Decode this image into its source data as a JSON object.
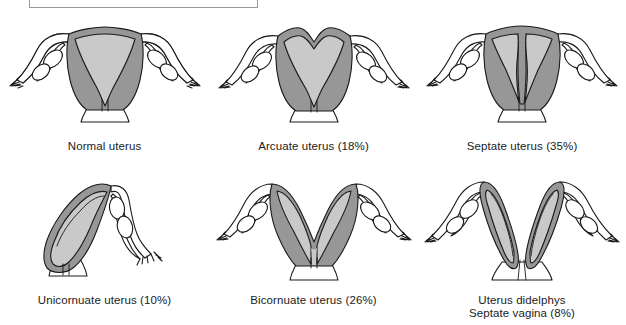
{
  "figure": {
    "title_box": {
      "text": "",
      "border_color": "#9a9a9a"
    },
    "colors": {
      "myometrium": "#979797",
      "endometrium": "#c9c9c9",
      "outline": "#1a1a1a",
      "background": "#ffffff",
      "caption": "#1b1b1b"
    },
    "panels": [
      {
        "id": "normal-uterus",
        "caption": "Normal uterus",
        "percent": null,
        "type": "normal"
      },
      {
        "id": "arcuate-uterus",
        "caption": "Arcuate uterus (18%)",
        "percent": "18%",
        "type": "arcuate"
      },
      {
        "id": "septate-uterus",
        "caption": "Septate uterus (35%)",
        "percent": "35%",
        "type": "septate"
      },
      {
        "id": "unicornuate-uterus",
        "caption": "Unicornuate uterus (10%)",
        "percent": "10%",
        "type": "unicornuate"
      },
      {
        "id": "bicornuate-uterus",
        "caption": "Bicornuate uterus (26%)",
        "percent": "26%",
        "type": "bicornuate"
      },
      {
        "id": "uterus-didelphys",
        "caption": "Uterus didelphys\nSeptate vagina (8%)",
        "percent": "8%",
        "type": "didelphys"
      }
    ]
  }
}
